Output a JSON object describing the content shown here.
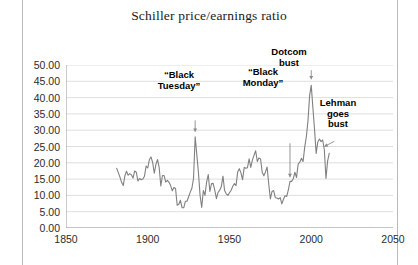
{
  "chart_data": {
    "type": "line",
    "title": "Schiller price/earnings ratio",
    "xlabel": "",
    "ylabel": "",
    "xlim": [
      1850,
      2050
    ],
    "ylim": [
      0,
      50
    ],
    "xticks": [
      "1850",
      "1900",
      "1950",
      "2000",
      "2050"
    ],
    "yticks": [
      "0.00",
      "5.00",
      "10.00",
      "15.00",
      "20.00",
      "25.00",
      "30.00",
      "35.00",
      "40.00",
      "45.00",
      "50.00"
    ],
    "grid": true,
    "legend": "none",
    "series_name": "Shiller CAPE ratio",
    "line_color": "#808080",
    "x": [
      1881,
      1882,
      1883,
      1884,
      1885,
      1886,
      1887,
      1888,
      1889,
      1890,
      1891,
      1892,
      1893,
      1894,
      1895,
      1896,
      1897,
      1898,
      1899,
      1900,
      1901,
      1902,
      1903,
      1904,
      1905,
      1906,
      1907,
      1908,
      1909,
      1910,
      1911,
      1912,
      1913,
      1914,
      1915,
      1916,
      1917,
      1918,
      1919,
      1920,
      1921,
      1922,
      1923,
      1924,
      1925,
      1926,
      1927,
      1928,
      1929,
      1930,
      1931,
      1932,
      1933,
      1934,
      1935,
      1936,
      1937,
      1938,
      1939,
      1940,
      1941,
      1942,
      1943,
      1944,
      1945,
      1946,
      1947,
      1948,
      1949,
      1950,
      1951,
      1952,
      1953,
      1954,
      1955,
      1956,
      1957,
      1958,
      1959,
      1960,
      1961,
      1962,
      1963,
      1964,
      1965,
      1966,
      1967,
      1968,
      1969,
      1970,
      1971,
      1972,
      1973,
      1974,
      1975,
      1976,
      1977,
      1978,
      1979,
      1980,
      1981,
      1982,
      1983,
      1984,
      1985,
      1986,
      1987,
      1988,
      1989,
      1990,
      1991,
      1992,
      1993,
      1994,
      1995,
      1996,
      1997,
      1998,
      1999,
      2000,
      2001,
      2002,
      2003,
      2004,
      2005,
      2006,
      2007,
      2008,
      2009,
      2010,
      2011
    ],
    "values": [
      18.3,
      17.0,
      15.6,
      14.0,
      13.0,
      16.0,
      17.4,
      16.2,
      16.7,
      16.3,
      15.3,
      17.5,
      17.1,
      14.4,
      15.2,
      14.8,
      15.0,
      15.9,
      19.0,
      18.4,
      21.0,
      21.8,
      20.1,
      16.8,
      19.5,
      21.0,
      18.5,
      12.9,
      16.1,
      16.1,
      14.1,
      14.6,
      14.0,
      13.0,
      11.4,
      12.4,
      12.1,
      7.0,
      7.3,
      8.5,
      6.2,
      6.2,
      8.2,
      8.2,
      9.6,
      11.0,
      12.2,
      15.2,
      28.0,
      22.5,
      17.0,
      10.0,
      6.3,
      11.5,
      10.0,
      14.1,
      16.4,
      11.2,
      13.6,
      13.7,
      11.6,
      9.0,
      10.9,
      11.6,
      12.7,
      15.9,
      11.5,
      10.5,
      10.0,
      10.8,
      11.6,
      12.8,
      13.6,
      13.0,
      17.2,
      18.2,
      16.9,
      14.8,
      18.6,
      18.3,
      18.5,
      21.2,
      18.6,
      20.8,
      22.3,
      23.7,
      20.4,
      21.5,
      21.2,
      17.1,
      16.0,
      17.2,
      18.7,
      13.5,
      8.9,
      11.2,
      11.5,
      9.3,
      9.2,
      8.9,
      9.3,
      7.4,
      8.8,
      9.9,
      9.7,
      11.7,
      14.3,
      14.3,
      15.1,
      17.1,
      15.5,
      19.6,
      20.2,
      21.4,
      20.4,
      24.8,
      28.0,
      32.9,
      40.6,
      43.8,
      36.9,
      30.3,
      22.9,
      26.4,
      27.3,
      26.5,
      27.0,
      24.0,
      15.2,
      20.5,
      22.9
    ],
    "annotations": [
      {
        "id": "black-tuesday",
        "text": "“Black\nTuesday”",
        "x": 1929,
        "y": 28.0,
        "arrow": "down"
      },
      {
        "id": "black-monday",
        "text": "“Black\nMonday”",
        "x": 1987,
        "y": 14.3,
        "arrow": "down"
      },
      {
        "id": "dotcom-bust",
        "text": "Dotcom\nbust",
        "x": 2000,
        "y": 43.8,
        "arrow": "down"
      },
      {
        "id": "lehman-goes-bust",
        "text": "Lehman\ngoes\nbust",
        "x": 2008,
        "y": 24.0,
        "arrow": "down-left"
      }
    ]
  }
}
